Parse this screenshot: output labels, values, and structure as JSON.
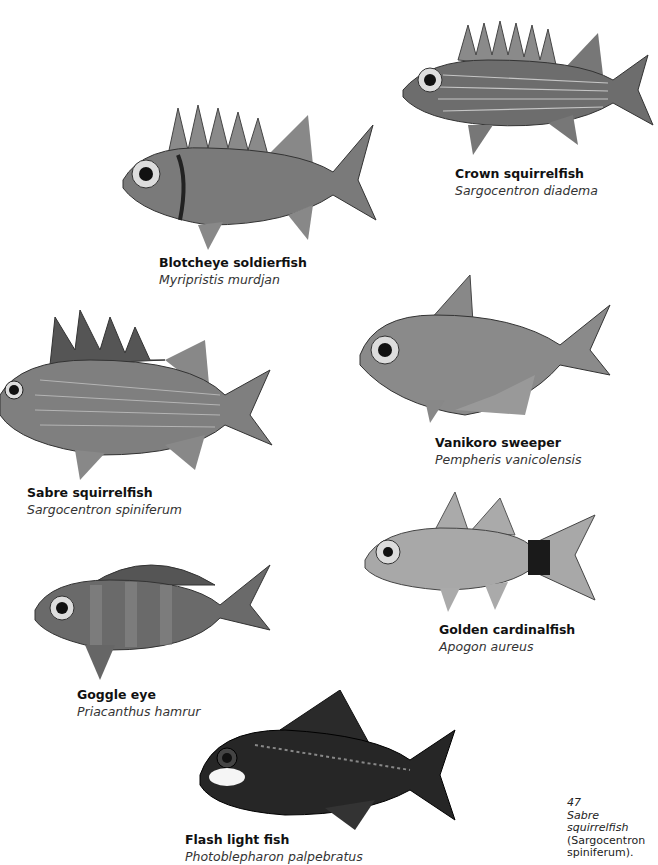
{
  "plate": {
    "number": "47",
    "caption_common": "Sabre squirrelfish",
    "caption_latin_line1": "(Sargocentron",
    "caption_latin_line2": "spiniferum)."
  },
  "fish": [
    {
      "id": "crown-squirrelfish",
      "common": "Crown squirrelfish",
      "latin": "Sargocentron diadema",
      "tone": "#6d6d6d",
      "tail_patch": false
    },
    {
      "id": "blotcheye-soldierfish",
      "common": "Blotcheye soldierfish",
      "latin": "Myripristis murdjan",
      "tone": "#7a7a7a",
      "tail_patch": false
    },
    {
      "id": "sabre-squirrelfish",
      "common": "Sabre squirrelfish",
      "latin": "Sargocentron spiniferum",
      "tone": "#7f7f7f",
      "tail_patch": false
    },
    {
      "id": "vanikoro-sweeper",
      "common": "Vanikoro sweeper",
      "latin": "Pempheris vanicolensis",
      "tone": "#8a8a8a",
      "tail_patch": false
    },
    {
      "id": "golden-cardinalfish",
      "common": "Golden cardinalfish",
      "latin": "Apogon aureus",
      "tone": "#a8a8a8",
      "tail_patch": true
    },
    {
      "id": "goggle-eye",
      "common": "Goggle eye",
      "latin": "Priacanthus hamrur",
      "tone": "#6a6a6a",
      "tail_patch": false
    },
    {
      "id": "flash-light-fish",
      "common": "Flash light fish",
      "latin": "Photoblepharon palpebratus",
      "tone": "#262626",
      "tail_patch": false
    }
  ],
  "colors": {
    "page_bg": "#ffffff",
    "text": "#111111",
    "latin_text": "#333333"
  }
}
